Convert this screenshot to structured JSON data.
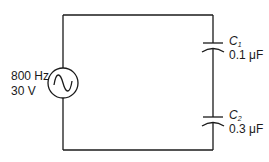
{
  "diagram": {
    "type": "AC circuit with series capacitors",
    "source": {
      "frequency_label": "800 Hz",
      "voltage_label": "30 V",
      "symbol": "ac-sine-source"
    },
    "capacitors": [
      {
        "name": "C",
        "subscript": "1",
        "value_label": "0.1 μF"
      },
      {
        "name": "C",
        "subscript": "2",
        "value_label": "0.3 μF"
      }
    ],
    "colors": {
      "wire": "#1a1a1a",
      "background": "#ffffff"
    }
  }
}
